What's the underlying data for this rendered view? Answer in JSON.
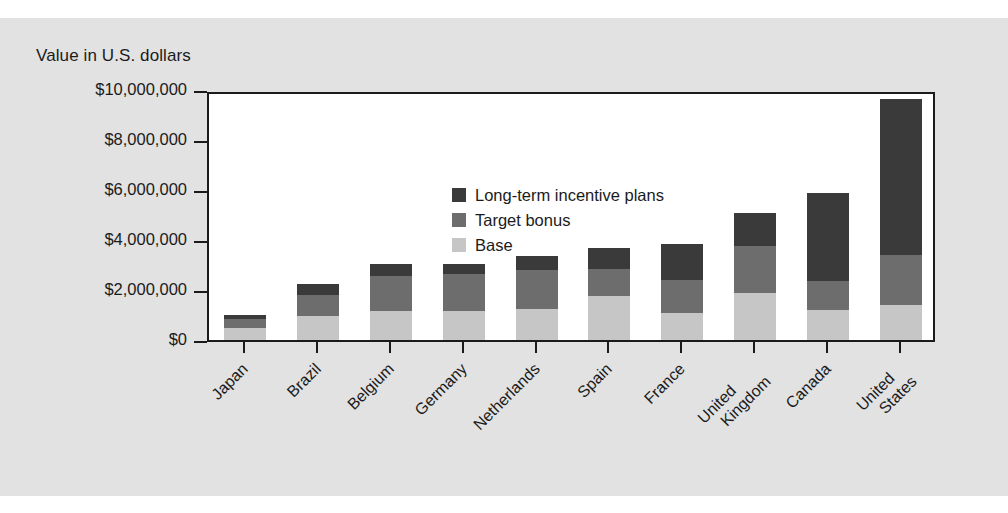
{
  "chart_data": {
    "type": "bar",
    "subtype": "stacked-bar",
    "title": "",
    "ylabel": "Value in U.S. dollars",
    "xlabel": "",
    "ylim": [
      0,
      10000000
    ],
    "ytick_values": [
      0,
      2000000,
      4000000,
      6000000,
      8000000,
      10000000
    ],
    "ytick_labels": [
      "$0",
      "$2,000,000",
      "$4,000,000",
      "$6,000,000",
      "$8,000,000",
      "$10,000,000"
    ],
    "grid": false,
    "legend_position": "upper-left-inside",
    "categories": [
      "Japan",
      "Brazil",
      "Belgium",
      "Germany",
      "Netherlands",
      "Spain",
      "France",
      "United Kingdom",
      "Canada",
      "United States"
    ],
    "category_lines": [
      [
        "Japan"
      ],
      [
        "Brazil"
      ],
      [
        "Belgium"
      ],
      [
        "Germany"
      ],
      [
        "Netherlands"
      ],
      [
        "Spain"
      ],
      [
        "France"
      ],
      [
        "United",
        "Kingdom"
      ],
      [
        "Canada"
      ],
      [
        "United",
        "States"
      ]
    ],
    "series": [
      {
        "name": "Base",
        "color": "#c6c6c6",
        "values": [
          500000,
          950000,
          1150000,
          1150000,
          1250000,
          1750000,
          1100000,
          1900000,
          1200000,
          1400000
        ]
      },
      {
        "name": "Target bonus",
        "color": "#6d6d6d",
        "values": [
          350000,
          850000,
          1400000,
          1500000,
          1550000,
          1100000,
          1300000,
          1850000,
          1150000,
          2000000
        ]
      },
      {
        "name": "Long-term incentive plans",
        "color": "#3a3a3a",
        "values": [
          150000,
          450000,
          500000,
          400000,
          550000,
          850000,
          1450000,
          1350000,
          3550000,
          6250000
        ]
      }
    ],
    "totals": [
      1000000,
      2250000,
      3050000,
      3050000,
      3350000,
      3700000,
      3850000,
      5100000,
      5900000,
      9650000
    ]
  },
  "legend": {
    "items": [
      {
        "label": "Long-term incentive plans",
        "color": "#3a3a3a"
      },
      {
        "label": "Target bonus",
        "color": "#6d6d6d"
      },
      {
        "label": "Base",
        "color": "#c6c6c6"
      }
    ]
  },
  "colors": {
    "lti": "#3a3a3a",
    "bonus": "#6d6d6d",
    "base": "#c6c6c6",
    "axis": "#1b1b1b",
    "plot_background": "#ffffff",
    "page_background": "#e2e2e2"
  }
}
